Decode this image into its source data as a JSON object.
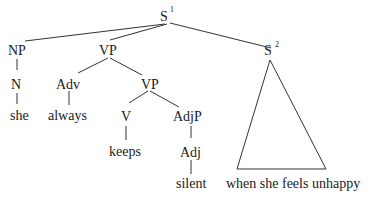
{
  "diagram": {
    "type": "syntax-tree",
    "colors": {
      "line": "#333333",
      "text": "#1a1a1a",
      "background": "#ffffff"
    },
    "nodes": {
      "s1": {
        "label": "S",
        "sup": "1"
      },
      "np": {
        "label": "NP"
      },
      "vp1": {
        "label": "VP"
      },
      "s2": {
        "label": "S",
        "sup": "2"
      },
      "n": {
        "label": "N"
      },
      "adv": {
        "label": "Adv"
      },
      "vp2": {
        "label": "VP"
      },
      "v": {
        "label": "V"
      },
      "adjp": {
        "label": "AdjP"
      },
      "adj": {
        "label": "Adj"
      }
    },
    "leaves": {
      "she": "she",
      "always": "always",
      "keeps": "keeps",
      "silent": "silent",
      "clause": "when she feels unhappy"
    },
    "edges": [
      [
        "S1",
        "NP"
      ],
      [
        "S1",
        "VP"
      ],
      [
        "S1",
        "S2"
      ],
      [
        "NP",
        "N"
      ],
      [
        "N",
        "she"
      ],
      [
        "VP",
        "Adv"
      ],
      [
        "VP",
        "VP"
      ],
      [
        "Adv",
        "always"
      ],
      [
        "VP",
        "V"
      ],
      [
        "VP",
        "AdjP"
      ],
      [
        "V",
        "keeps"
      ],
      [
        "AdjP",
        "Adj"
      ],
      [
        "Adj",
        "silent"
      ],
      [
        "S2",
        "when she feels unhappy (triangle)"
      ]
    ]
  }
}
